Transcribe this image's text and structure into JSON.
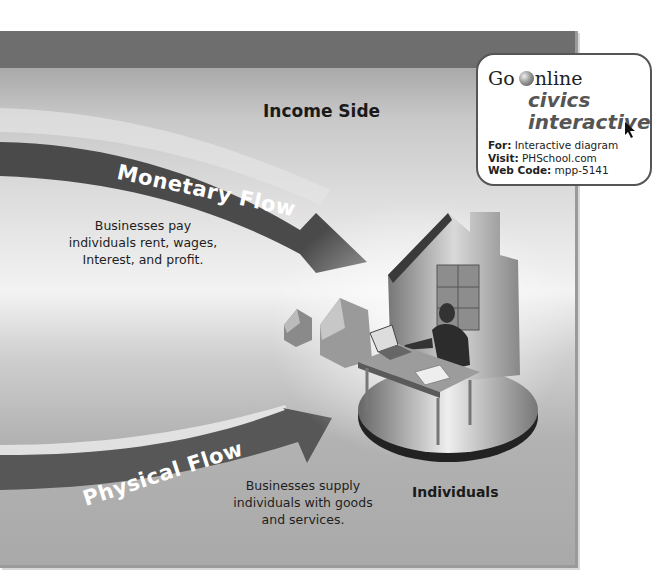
{
  "diagram": {
    "section_title": "Income Side",
    "entity_label": "Individuals",
    "flows": [
      {
        "label": "Monetary Flow",
        "description": "Businesses pay individuals rent, wages, Interest, and profit.",
        "description_lines": [
          "Businesses pay",
          "individuals rent,  wages,",
          "Interest, and profit."
        ]
      },
      {
        "label": "Physical Flow",
        "description": "Businesses supply individuals with goods and services.",
        "description_lines": [
          "Businesses supply",
          "individuals with goods",
          "and services."
        ]
      }
    ],
    "colors": {
      "arrow_dark": "#4a4a4a",
      "band": "#6e6e6e",
      "panel_light": "#f3f3f3"
    }
  },
  "go_online": {
    "go": "Go",
    "online": "nline",
    "brand_line1": "civics",
    "brand_line2": "interactive",
    "for_label": "For:",
    "for_value": "Interactive diagram",
    "visit_label": "Visit:",
    "visit_value": "PHSchool.com",
    "code_label": "Web Code:",
    "code_value": "mpp-5141"
  }
}
